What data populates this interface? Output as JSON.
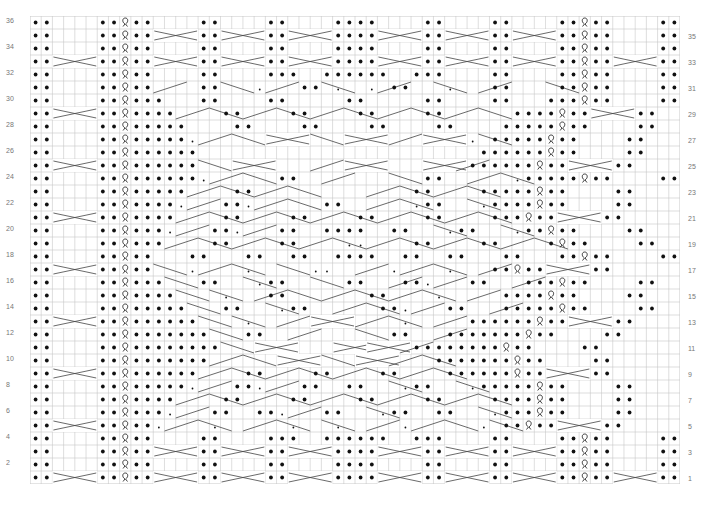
{
  "chart_title": "",
  "grid": {
    "columns": 58,
    "rows": 36,
    "cell_width": 11.2,
    "cell_height": 13,
    "line_color": "#c8c8c8",
    "symbol_color": "#111111"
  },
  "legend": {
    "P": "purl",
    ".": "knit",
    "Q": "twisted knit",
    "X": "4-stitch cable cross",
    "/": "diagonal cable (right)",
    "\\": "diagonal cable (left)",
    "d": "small purl dot"
  },
  "row_numbers": {
    "left_even": [
      "36",
      "34",
      "32",
      "30",
      "28",
      "26",
      "24",
      "22",
      "20",
      "18",
      "16",
      "14",
      "12",
      "10",
      "8",
      "6",
      "4",
      "2"
    ],
    "right_odd": [
      "35",
      "33",
      "31",
      "29",
      "27",
      "25",
      "23",
      "21",
      "19",
      "17",
      "15",
      "13",
      "11",
      "9",
      "7",
      "5",
      "3",
      "1"
    ]
  },
  "rows": [
    {
      "n": 36,
      "cells": "PP....PPQPP....PP....PP....PPPP....PP....PP....PPQPP....PP"
    },
    {
      "n": 35,
      "cells": "PP....PPQPPX...PPX...PPX...PPPPX...PPX...PPX...PPQPP....PP"
    },
    {
      "n": 34,
      "cells": "PP....PPQPP....PP....PP....PPPP....PP....PP....PPQPP....PP"
    },
    {
      "n": 33,
      "cells": "PPX...PPQPPX...PPX...PPX...PPPPX...PPX...PPX...PPQPPX...PP"
    },
    {
      "n": 32,
      "cells": "PP....PPQPP....PP....PPP..PPPPPP..PPP....PP....PPQPP....PP"
    },
    {
      "n": 31,
      "cells": "PP....PPQPP/...PP\\..d/..PP\\d..d/PP..\\d../PP...\\PPQPP....PP"
    },
    {
      "n": 30,
      "cells": "PP....PPQPPP...PP....PP.....PP.....PP....PP...PPPQPP....PP"
    },
    {
      "n": 29,
      "cells": "PPX...PPQPPPP/..\\PP/..\\PP/..\\PP/..\\PP/..\\..PPPPQPPX...PP"
    },
    {
      "n": 28,
      "cells": "PP....PPQPPPPP....PP....PP....PP....PP....PPPPPQPP....PP.."
    },
    {
      "n": 27,
      "cells": "PP....PPQPPPPPd/..\\..X...\\..X.../..X...d\\PPPPPQPP....PP.."
    },
    {
      "n": 26,
      "cells": "PP....PPQPPPPPP.........................PPPPPPQPP....PP.."
    },
    {
      "n": 25,
      "cells": "PPX...PPQPPPPPP\\..X....../..X......X../PPPPPPQPPX...PP.."
    },
    {
      "n": 24,
      "cells": "PP....PPQPPPPPPd/..\\..PP../.....\\..PP../..\\dPPPPPQPP....PP"
    },
    {
      "n": 23,
      "cells": "PP....PPQPPPPP/..\\PP/..\\....../..\\PP/..\\PPPPPQPP....PP.."
    },
    {
      "n": 22,
      "cells": "PP....PPQPPPPd/..PPd/..\\..PP../..\\dPP..\\dPPPPQPP....PP.."
    },
    {
      "n": 21,
      "cells": "PPX...PPQPPPP/..\\PP/..\\PP/..\\PP/..\\PP/..\\PPPQPPX...PP.."
    },
    {
      "n": 20,
      "cells": "PP....PPQPPPd/..PPd/..PP..PPPP..PP..\\dPP..\\dPPQPP....PP.."
    },
    {
      "n": 19,
      "cells": "PP....PPQPPP/..\\PP/..\\PP/..\\dd/..\\PP/..\\PP/..\\PQPP....PP"
    },
    {
      "n": 18,
      "cells": "PP....PPQPP...PP...PP..PP..PPPP..PP..PP...PP...PPQPP....PP"
    },
    {
      "n": 17,
      "cells": "PPX...PPQPP\\..d/..\\d..\\..dd../..d/..\\d../PPQPPX...PP...."
    },
    {
      "n": 16,
      "cells": "PP....PPQPPP\\..PP..\\dPP..\\..PP../PPd/..PP../PPPQPP....PP"
    },
    {
      "n": 15,
      "cells": "PP....PPQPPPP\\..\\d../PP\\../..\\PP/..\\d../..PPPPQPP....PP"
    },
    {
      "n": 14,
      "cells": "PP....PPQPPPPP\\..PP..\\dPP../..\\PPd/..PP../PPPPPQPP....PP"
    },
    {
      "n": 13,
      "cells": "PPX...PPQPPPPPP\\..\\d../..X.../..\\d../..PPPPPPQPPX...PP"
    },
    {
      "n": 12,
      "cells": "PP....PPQPPPPPPP\\..PP../.....\\..PP../PPPPPPPQPP....PP.."
    },
    {
      "n": 11,
      "cells": "PP....PPQPPPPPPPP\\..X......X..X../PPPPPPPPQPP....PP...."
    },
    {
      "n": 10,
      "cells": "PP....PPQPPPPPPP/..\\..X...\\..X../..\\PPPPPPPQPP....PP.."
    },
    {
      "n": 9,
      "cells": "PPX...PPQPPPPPP/..\\PP/..\\PP/..\\PP/..\\PPPPPPQPPX...PP.."
    },
    {
      "n": 8,
      "cells": "PP....PPQPPPPPd/..PPd/..PP..PP..\\dPP..\\dPPPPPQPP....PP"
    },
    {
      "n": 7,
      "cells": "PP....PPQPPPP/..\\PP/..\\PP/..\\PP/..\\PP/..\\PPPPQPP....PP"
    },
    {
      "n": 6,
      "cells": "PP....PPQPPPd/..PP..PPd/..PP..\\dPP..PP..\\dPPPQPP....PP"
    },
    {
      "n": 5,
      "cells": "PPX...PPQPPd/..\\d../..\\d..\\d../..d/..\\..d\\PPQPPX...PP"
    },
    {
      "n": 4,
      "cells": "PP....PPQPP....PP....PPP..PPPPPP..PPP....PP....PPQPP....PP"
    },
    {
      "n": 3,
      "cells": "PP....PPQPPX...PPX...PPX...PPPPX...PPX...PPX...PPQPP....PP"
    },
    {
      "n": 2,
      "cells": "PP....PPQPP....PP....PP....PPPP....PP....PP....PPQPP....PP"
    },
    {
      "n": 1,
      "cells": "PPX...PPQPPX...PPX...PPX...PPPPX...PPX...PPX...PPQPPX...PP"
    }
  ]
}
